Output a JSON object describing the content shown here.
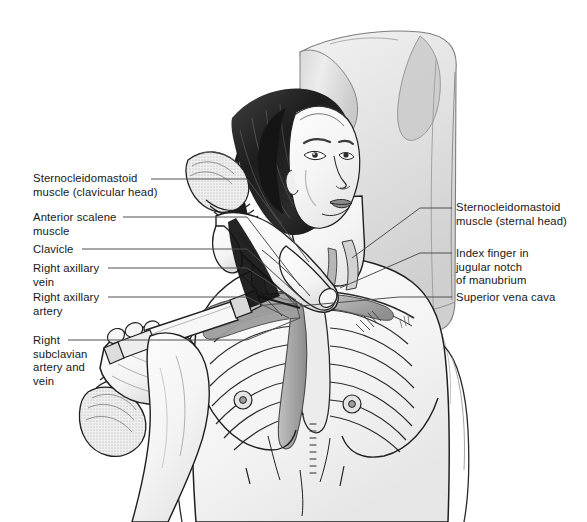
{
  "figure": {
    "width": 587,
    "height": 522,
    "background_color": "#ffffff",
    "line_color": "#4f4f4f",
    "text_color": "#171717",
    "style": "grayscale pen-and-ink medical illustration"
  },
  "scene": {
    "patient": "supine adult female, head turned to her left, arms abducted, bare chest with rib cage and clavicles drawn through the skin",
    "pillow": "large pale pillow/rolled sheet behind the head and right shoulder",
    "operator": "two gloved hands; left gloved hand holds the syringe and needle aimed under the clavicle, right gloved index finger rests in the jugular notch of the manubrium",
    "instrument": "syringe with long introducer needle entering below the right clavicle"
  },
  "labels_left": [
    {
      "id": "sternocleidomastoid-clavicular-head",
      "lines": [
        "Sternocleidomastoid",
        "muscle (clavicular head)"
      ],
      "x": 33,
      "y": 172,
      "leader": {
        "x1": 151,
        "y1": 179,
        "x2": 247,
        "y2": 179
      }
    },
    {
      "id": "anterior-scalene-muscle",
      "lines": [
        "Anterior scalene",
        "muscle"
      ],
      "x": 33,
      "y": 211,
      "leader": {
        "x1": 123,
        "y1": 217,
        "x2": 247,
        "y2": 217
      }
    },
    {
      "id": "clavicle",
      "lines": [
        "Clavicle"
      ],
      "x": 33,
      "y": 243,
      "leader": {
        "x1": 82,
        "y1": 249,
        "x2": 247,
        "y2": 249
      }
    },
    {
      "id": "right-axillary-vein",
      "lines": [
        "Right axillary",
        "vein"
      ],
      "x": 33,
      "y": 262,
      "leader": {
        "x1": 108,
        "y1": 268,
        "x2": 247,
        "y2": 268
      }
    },
    {
      "id": "right-axillary-artery",
      "lines": [
        "Right axillary",
        "artery"
      ],
      "x": 33,
      "y": 291,
      "leader": {
        "x1": 108,
        "y1": 297,
        "x2": 247,
        "y2": 297
      }
    },
    {
      "id": "right-subclavian-artery-and-vein",
      "lines": [
        "Right",
        "subclavian",
        "artery and",
        "vein"
      ],
      "x": 33,
      "y": 334,
      "leader": {
        "x1": 68,
        "y1": 340,
        "x2": 247,
        "y2": 340
      }
    }
  ],
  "labels_right": [
    {
      "id": "sternocleidomastoid-sternal-head",
      "lines": [
        "Sternocleidomastoid",
        "muscle (sternal head)"
      ],
      "x": 456,
      "y": 201,
      "leader": {
        "x1": 420,
        "y1": 208,
        "x2": 452,
        "y2": 208
      }
    },
    {
      "id": "index-finger-jugular-notch",
      "lines": [
        "Index finger in",
        "jugular notch",
        "of manubrium"
      ],
      "x": 456,
      "y": 247,
      "leader": {
        "x1": 420,
        "y1": 253,
        "x2": 452,
        "y2": 253
      }
    },
    {
      "id": "superior-vena-cava",
      "lines": [
        "Superior vena cava"
      ],
      "x": 456,
      "y": 291,
      "leader": {
        "x1": 399,
        "y1": 297,
        "x2": 452,
        "y2": 297
      }
    }
  ],
  "internal_leaders": [
    {
      "id": "smcl-to-neck",
      "x1": 247,
      "y1": 179,
      "x2": 309,
      "y2": 262
    },
    {
      "id": "scalene-to-neck",
      "x1": 247,
      "y1": 217,
      "x2": 300,
      "y2": 286
    },
    {
      "id": "clavicle-to-bone",
      "x1": 247,
      "y1": 249,
      "x2": 300,
      "y2": 297
    },
    {
      "id": "axvein-to-vessel",
      "x1": 247,
      "y1": 268,
      "x2": 296,
      "y2": 300
    },
    {
      "id": "axartery-to-vessel",
      "x1": 247,
      "y1": 297,
      "x2": 289,
      "y2": 318
    },
    {
      "id": "subclavian-to-vessel",
      "x1": 247,
      "y1": 340,
      "x2": 300,
      "y2": 318
    },
    {
      "id": "sternal-head-to-neck",
      "x1": 420,
      "y1": 208,
      "x2": 352,
      "y2": 258
    },
    {
      "id": "finger-to-hand",
      "x1": 420,
      "y1": 253,
      "x2": 340,
      "y2": 288
    },
    {
      "id": "svc-to-vessel",
      "x1": 399,
      "y1": 297,
      "x2": 300,
      "y2": 306
    }
  ]
}
